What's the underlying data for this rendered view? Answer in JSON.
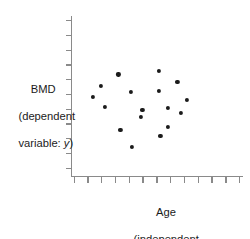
{
  "chart_data": {
    "type": "scatter",
    "title": "",
    "xlabel": "Age (independent variable: x)",
    "ylabel": "BMD (dependent variable: y)",
    "xlabel_lines": [
      "Age",
      "(independent",
      "variable: x)"
    ],
    "ylabel_lines": [
      "BMD",
      "(dependent",
      "variable: y)"
    ],
    "grid": false,
    "legend": "none",
    "axis_tick_labels_shown": false,
    "xlim": [
      0,
      100
    ],
    "ylim": [
      0,
      100
    ],
    "x_tick_count": 13,
    "y_tick_count": 11,
    "point_color": "#1b1b1b",
    "axis_color": "#8a8a8a",
    "points": [
      {
        "x": 27.3,
        "y": 63.4
      },
      {
        "x": 17.0,
        "y": 56.2
      },
      {
        "x": 34.5,
        "y": 52.5
      },
      {
        "x": 19.3,
        "y": 43.1
      },
      {
        "x": 51.2,
        "y": 65.6
      },
      {
        "x": 61.7,
        "y": 58.8
      },
      {
        "x": 51.2,
        "y": 53.1
      },
      {
        "x": 67.5,
        "y": 47.5
      },
      {
        "x": 56.0,
        "y": 42.5
      },
      {
        "x": 40.5,
        "y": 36.9
      },
      {
        "x": 56.0,
        "y": 30.6
      },
      {
        "x": 28.5,
        "y": 28.8
      },
      {
        "x": 51.8,
        "y": 25.0
      },
      {
        "x": 35.1,
        "y": 18.1
      },
      {
        "x": 41.3,
        "y": 41.3
      },
      {
        "x": 12.3,
        "y": 49.4
      },
      {
        "x": 64.0,
        "y": 39.4
      }
    ]
  },
  "figure": {
    "y_axis_name": "BMD",
    "x_axis_name": "Age",
    "dependent_note": "(dependent variable: y)",
    "independent_note": "(independent variable: x)"
  }
}
